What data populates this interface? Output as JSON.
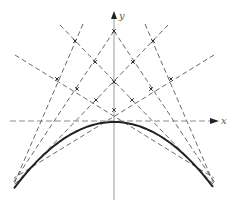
{
  "figure": {
    "axes": {
      "x_label": "x",
      "y_label": "y",
      "origin": [
        114,
        121
      ],
      "x_range_px": [
        10,
        218
      ],
      "y_range_px": [
        12,
        200
      ]
    },
    "curve": {
      "type": "parabola",
      "vertex": [
        114,
        122
      ],
      "left_end": [
        14,
        187
      ],
      "right_end": [
        213,
        187
      ]
    },
    "tangent_lines": [
      {
        "id": "t1",
        "x1": 60,
        "y1": 25,
        "x2": 215,
        "y2": 186
      },
      {
        "id": "t2",
        "x1": 168,
        "y1": 25,
        "x2": 13,
        "y2": 186
      },
      {
        "id": "t3",
        "x1": 83,
        "y1": 24,
        "x2": 14,
        "y2": 184
      },
      {
        "id": "t4",
        "x1": 145,
        "y1": 24,
        "x2": 214,
        "y2": 184
      },
      {
        "id": "t5",
        "x1": 114,
        "y1": 31,
        "x2": 13,
        "y2": 183
      },
      {
        "id": "t6",
        "x1": 114,
        "y1": 31,
        "x2": 215,
        "y2": 183
      },
      {
        "id": "t7",
        "x1": 15,
        "y1": 55,
        "x2": 214,
        "y2": 178
      },
      {
        "id": "t8",
        "x1": 214,
        "y1": 55,
        "x2": 14,
        "y2": 178
      }
    ],
    "intersection_marks": [
      [
        114,
        31
      ],
      [
        114,
        82
      ],
      [
        114,
        110
      ],
      [
        75,
        41
      ],
      [
        153,
        41
      ],
      [
        57,
        79
      ],
      [
        171,
        79
      ],
      [
        95,
        62
      ],
      [
        133,
        62
      ],
      [
        77,
        89
      ],
      [
        151,
        89
      ],
      [
        96,
        100
      ],
      [
        132,
        100
      ]
    ],
    "colors": {
      "curve": "#222222",
      "tangent": "#6a6a6a",
      "axis": "#9a9a9a"
    }
  }
}
